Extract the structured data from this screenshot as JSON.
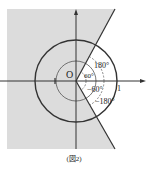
{
  "figure": {
    "caption": "(図2)",
    "origin_label": "O",
    "unit_label": "1",
    "angle_labels": {
      "upper_inner": "60°",
      "upper_outer": "180°",
      "lower_inner": "−60°",
      "lower_outer": "−180°"
    },
    "colors": {
      "shaded_region": "#dcdcdc",
      "lines": "#333333",
      "background": "#ffffff"
    }
  }
}
